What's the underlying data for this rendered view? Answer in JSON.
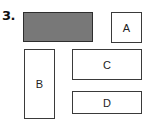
{
  "problem": {
    "number_label": "3."
  },
  "colors": {
    "shaded_fill": "#787878",
    "border": "#3a3a3a",
    "background": "#ffffff"
  },
  "shapes": [
    {
      "id": "shaded",
      "label": "",
      "x": 23,
      "y": 12,
      "w": 70,
      "h": 30,
      "filled": true
    },
    {
      "id": "A",
      "label": "A",
      "x": 111,
      "y": 12,
      "w": 31,
      "h": 31,
      "filled": false
    },
    {
      "id": "B",
      "label": "B",
      "x": 24,
      "y": 49,
      "w": 31,
      "h": 70,
      "filled": false
    },
    {
      "id": "C",
      "label": "C",
      "x": 72,
      "y": 49,
      "w": 70,
      "h": 31,
      "filled": false
    },
    {
      "id": "D",
      "label": "D",
      "x": 72,
      "y": 91,
      "w": 70,
      "h": 23,
      "filled": false
    }
  ]
}
